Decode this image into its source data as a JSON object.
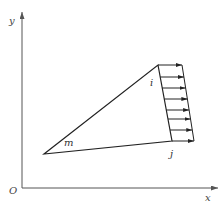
{
  "diagram": {
    "axes": {
      "x_label": "x",
      "y_label": "y",
      "origin_label": "O",
      "color": "#555555"
    },
    "triangle": {
      "vertices": {
        "i": {
          "label": "i"
        },
        "j": {
          "label": "j"
        },
        "m": {
          "label": "m"
        }
      },
      "color": "#222222"
    },
    "distributed_load": {
      "edge": "i-j",
      "direction": "+x",
      "arrow_count": 8,
      "color": "#222222"
    }
  }
}
